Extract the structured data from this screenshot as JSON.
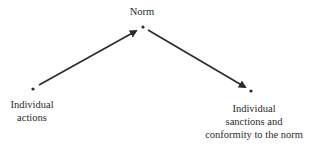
{
  "diagram": {
    "nodes": [
      {
        "id": "norm",
        "label_lines": [
          "Norm"
        ]
      },
      {
        "id": "individual-actions",
        "label_lines": [
          "Individual",
          "actions"
        ]
      },
      {
        "id": "sanctions",
        "label_lines": [
          "Individual",
          "sanctions and",
          "conformity to the norm"
        ]
      }
    ],
    "edges": [
      {
        "from": "individual-actions",
        "to": "norm"
      },
      {
        "from": "norm",
        "to": "sanctions"
      }
    ],
    "colors": {
      "ink": "#2a2a2a",
      "background": "#ffffff"
    }
  }
}
